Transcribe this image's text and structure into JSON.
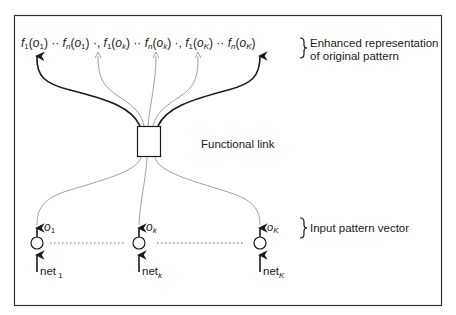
{
  "outputs": {
    "terms": [
      {
        "f": "f",
        "fsub": "1",
        "o": "o",
        "osub": "1",
        "sep": " ·· "
      },
      {
        "f": "f",
        "fsub": "n",
        "o": "o",
        "osub": "1",
        "sep": " ·, "
      },
      {
        "f": "f",
        "fsub": "1",
        "o": "o",
        "osub": "k",
        "sep": " ·· "
      },
      {
        "f": "f",
        "fsub": "n",
        "o": "o",
        "osub": "k",
        "sep": " ·, "
      },
      {
        "f": "f",
        "fsub": "1",
        "o": "o",
        "osub": "K",
        "sep": " ·· "
      },
      {
        "f": "f",
        "fsub": "n",
        "o": "o",
        "osub": "K",
        "sep": ""
      }
    ],
    "brace_label_line1": "Enhanced representation",
    "brace_label_line2": "of original pattern"
  },
  "functional_link": {
    "label": "Functional link"
  },
  "inputs": {
    "nodes": [
      {
        "o": "o",
        "osub": "1",
        "net": "net",
        "netsub": "1"
      },
      {
        "o": "o",
        "osub": "k",
        "net": "net",
        "netsub": "k"
      },
      {
        "o": "o",
        "osub": "K",
        "net": "net",
        "netsub": "K"
      }
    ],
    "brace_label": "Input pattern vector"
  },
  "colors": {
    "ink": "#1a1a1a",
    "thin_line": "#8a8a8a",
    "frame": "#333333",
    "background": "#ffffff"
  }
}
